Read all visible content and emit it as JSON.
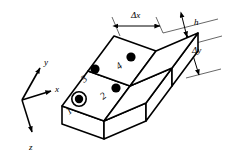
{
  "figure": {
    "type": "diagram",
    "background_color": "#ffffff",
    "stroke_color": "#000000",
    "width": 226,
    "height": 157
  },
  "axes": {
    "origin": {
      "x": 22,
      "y": 100
    },
    "items": [
      {
        "id": "y",
        "label": "y",
        "tip": {
          "x": 40,
          "y": 66
        },
        "label_pos": {
          "x": 43,
          "y": 62
        }
      },
      {
        "id": "x",
        "label": "x",
        "tip": {
          "x": 52,
          "y": 90
        },
        "label_pos": {
          "x": 55,
          "y": 89
        }
      },
      {
        "id": "z",
        "label": "z",
        "tip": {
          "x": 32,
          "y": 134
        },
        "label_pos": {
          "x": 31,
          "y": 148
        }
      }
    ]
  },
  "nodes": [
    {
      "id": 1,
      "label": "1",
      "ringed": true,
      "dot": {
        "x": 79,
        "y": 99
      },
      "label_pos": {
        "x": 71,
        "y": 113
      }
    },
    {
      "id": 2,
      "label": "2",
      "ringed": false,
      "dot": {
        "x": 116,
        "y": 88
      },
      "label_pos": {
        "x": 106,
        "y": 98
      }
    },
    {
      "id": 3,
      "label": "3",
      "ringed": false,
      "dot": {
        "x": 95,
        "y": 69
      },
      "label_pos": {
        "x": 86,
        "y": 81
      }
    },
    {
      "id": 4,
      "label": "4",
      "ringed": false,
      "dot": {
        "x": 131,
        "y": 57
      },
      "label_pos": {
        "x": 122,
        "y": 69
      }
    }
  ],
  "dimensions": [
    {
      "id": "dx",
      "label": "Δx",
      "label_pos": {
        "x": 140,
        "y": 14
      },
      "from": {
        "x": 117,
        "y": 25
      },
      "to": {
        "x": 160,
        "y": 25
      }
    },
    {
      "id": "h",
      "label": "h",
      "label_pos": {
        "x": 196,
        "y": 22
      },
      "from": {
        "x": 182,
        "y": 17
      },
      "to": {
        "x": 188,
        "y": 37
      }
    },
    {
      "id": "dy",
      "label": "Δy",
      "label_pos": {
        "x": 197,
        "y": 50
      },
      "from": {
        "x": 188,
        "y": 38
      },
      "to": {
        "x": 200,
        "y": 74
      }
    }
  ],
  "annotations": {
    "cell_count": 4,
    "grid": "2x2",
    "highlighted_node": 1
  }
}
